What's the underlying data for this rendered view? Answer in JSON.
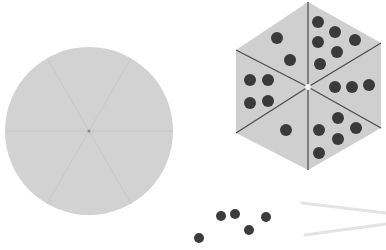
{
  "scene": {
    "width": 386,
    "height": 250,
    "background": "#ffffff"
  },
  "blank_spinner": {
    "shape": "circle",
    "center": [
      89,
      131
    ],
    "radius": 84,
    "fill": "#d2d2d2",
    "divider_color": "#c4c4c4",
    "sector_count": 6
  },
  "dot_spinner": {
    "shape": "hexagon",
    "fill": "#cfcfcf",
    "line_color": "#4a4a4a",
    "vertices": [
      [
        308,
        2
      ],
      [
        381,
        43
      ],
      [
        381,
        128
      ],
      [
        308,
        170
      ],
      [
        236,
        133
      ],
      [
        236,
        50
      ]
    ],
    "center": [
      308,
      87
    ],
    "dot_color": "#3a3a3a",
    "dot_radius": 6,
    "sectors": [
      {
        "name": "top-left",
        "count": 2,
        "dots": [
          [
            277,
            38
          ],
          [
            290,
            60
          ]
        ]
      },
      {
        "name": "top-right",
        "count": 6,
        "dots": [
          [
            318,
            22
          ],
          [
            335,
            32
          ],
          [
            355,
            40
          ],
          [
            318,
            42
          ],
          [
            337,
            52
          ],
          [
            320,
            64
          ]
        ]
      },
      {
        "name": "right",
        "count": 3,
        "dots": [
          [
            335,
            87
          ],
          [
            352,
            87
          ],
          [
            369,
            85
          ]
        ]
      },
      {
        "name": "bottom-right",
        "count": 5,
        "dots": [
          [
            338,
            118
          ],
          [
            319,
            130
          ],
          [
            356,
            128
          ],
          [
            338,
            139
          ],
          [
            319,
            153
          ]
        ]
      },
      {
        "name": "bottom-left",
        "count": 1,
        "dots": [
          [
            286,
            130
          ]
        ]
      },
      {
        "name": "left",
        "count": 4,
        "dots": [
          [
            250,
            80
          ],
          [
            268,
            80
          ],
          [
            250,
            103
          ],
          [
            268,
            101
          ]
        ]
      }
    ]
  },
  "loose_dots": {
    "color": "#3c3c3c",
    "radius": 5,
    "dots": [
      [
        199,
        238
      ],
      [
        221,
        216
      ],
      [
        235,
        214
      ],
      [
        249,
        230
      ],
      [
        266,
        217
      ]
    ]
  },
  "pointer_sticks": {
    "color": "#e4e4e4",
    "lines": [
      [
        [
          302,
          203
        ],
        [
          386,
          213
        ]
      ],
      [
        [
          305,
          235
        ],
        [
          386,
          224
        ]
      ]
    ]
  }
}
